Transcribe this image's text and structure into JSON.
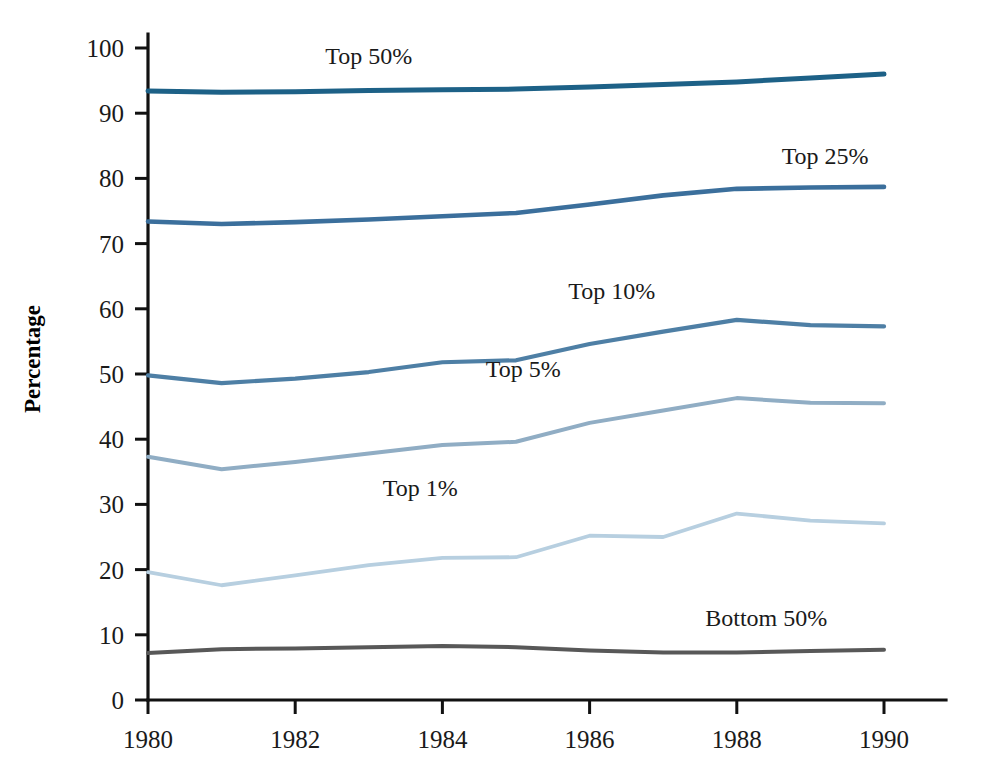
{
  "chart_data": {
    "type": "line",
    "title": "",
    "xlabel": "",
    "ylabel": "Percentage",
    "xlim": [
      1980,
      1990
    ],
    "ylim": [
      0,
      100
    ],
    "grid": false,
    "legend_position": "inline-labels",
    "x": [
      1980,
      1981,
      1982,
      1983,
      1984,
      1985,
      1986,
      1987,
      1988,
      1989,
      1990
    ],
    "x_ticks": [
      "1980",
      "1982",
      "1984",
      "1986",
      "1988",
      "1990"
    ],
    "x_tick_values": [
      1980,
      1982,
      1984,
      1986,
      1988,
      1990
    ],
    "y_ticks": [
      "0",
      "10",
      "20",
      "30",
      "40",
      "50",
      "60",
      "70",
      "80",
      "90",
      "100"
    ],
    "y_tick_values": [
      0,
      10,
      20,
      30,
      40,
      50,
      60,
      70,
      80,
      90,
      100
    ],
    "series": [
      {
        "name": "Top 50%",
        "color": "#1d6187",
        "values": [
          93.4,
          93.2,
          93.3,
          93.5,
          93.6,
          93.7,
          94.0,
          94.4,
          94.8,
          95.4,
          96.0
        ],
        "label_x": 1983.0,
        "label_y": 97.5
      },
      {
        "name": "Top 25%",
        "color": "#3b6f9c",
        "values": [
          73.4,
          73.0,
          73.3,
          73.7,
          74.2,
          74.7,
          76.0,
          77.4,
          78.4,
          78.6,
          78.7
        ],
        "label_x": 1989.2,
        "label_y": 82.2
      },
      {
        "name": "Top 10%",
        "color": "#4e7fa5",
        "values": [
          49.8,
          48.6,
          49.3,
          50.3,
          51.8,
          52.1,
          54.6,
          56.5,
          58.3,
          57.5,
          57.3
        ],
        "label_x": 1986.3,
        "label_y": 61.5
      },
      {
        "name": "Top 5%",
        "color": "#90adc4",
        "values": [
          37.3,
          35.4,
          36.5,
          37.8,
          39.1,
          39.6,
          42.5,
          44.4,
          46.3,
          45.6,
          45.5
        ],
        "label_x": 1985.1,
        "label_y": 49.5
      },
      {
        "name": "Top 1%",
        "color": "#b7cfe0",
        "values": [
          19.6,
          17.6,
          19.1,
          20.7,
          21.8,
          21.9,
          25.2,
          25.0,
          28.6,
          27.5,
          27.1
        ],
        "label_x": 1983.7,
        "label_y": 31.3
      },
      {
        "name": "Bottom 50%",
        "color": "#585858",
        "values": [
          7.2,
          7.8,
          7.9,
          8.1,
          8.3,
          8.1,
          7.6,
          7.3,
          7.3,
          7.5,
          7.7
        ],
        "label_x": 1988.4,
        "label_y": 11.4
      }
    ]
  }
}
